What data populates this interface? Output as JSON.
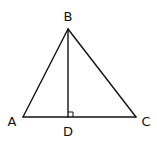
{
  "diagram": {
    "type": "geometry-triangle-with-altitude",
    "stroke_color": "#111111",
    "background": "#ffffff",
    "points": {
      "A": {
        "x": 23,
        "y": 117
      },
      "B": {
        "x": 68,
        "y": 29
      },
      "C": {
        "x": 136,
        "y": 117
      },
      "D": {
        "x": 68,
        "y": 117
      }
    },
    "labels": {
      "A": {
        "text": "A",
        "x": 12,
        "y": 122
      },
      "B": {
        "text": "B",
        "x": 68,
        "y": 17
      },
      "C": {
        "text": "C",
        "x": 146,
        "y": 122
      },
      "D": {
        "text": "D",
        "x": 68,
        "y": 132
      }
    },
    "segments": [
      {
        "name": "AB",
        "from": "A",
        "to": "B"
      },
      {
        "name": "BC",
        "from": "B",
        "to": "C"
      },
      {
        "name": "AC",
        "from": "A",
        "to": "C"
      },
      {
        "name": "BD",
        "from": "B",
        "to": "D"
      }
    ],
    "right_angle": {
      "at": "D",
      "size": 5
    }
  }
}
